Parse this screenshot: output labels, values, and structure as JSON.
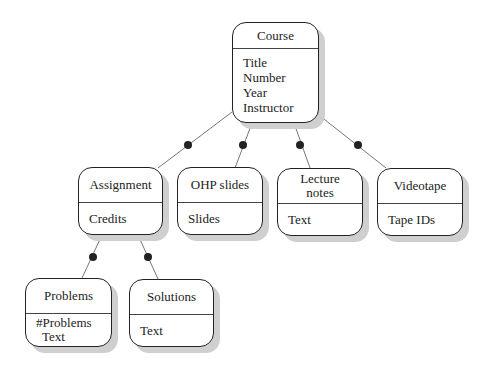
{
  "diagram": {
    "root": {
      "name": "Course",
      "attributes": [
        "Title",
        "Number",
        "Year",
        "Instructor"
      ]
    },
    "children": [
      {
        "name": "Assignment",
        "attributes": [
          "Credits"
        ]
      },
      {
        "name": "OHP slides",
        "attributes": [
          "Slides"
        ]
      },
      {
        "name": "Lecture notes",
        "name_lines": [
          "Lecture",
          "notes"
        ],
        "attributes": [
          "Text"
        ]
      },
      {
        "name": "Videotape",
        "attributes": [
          "Tape IDs"
        ]
      }
    ],
    "grandchildren": [
      {
        "name": "Problems",
        "attributes": [
          "#Problems",
          "Text"
        ]
      },
      {
        "name": "Solutions",
        "attributes": [
          "Text"
        ]
      }
    ]
  }
}
